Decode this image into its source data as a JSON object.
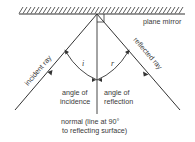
{
  "colors": {
    "line": "#333333",
    "text": "#3a3a3a",
    "background": "#ffffff"
  },
  "mirror": {
    "label": "plane mirror"
  },
  "rays": {
    "incident_label": "incident ray",
    "reflected_label": "reflected ray"
  },
  "angles": {
    "incidence_symbol": "i",
    "reflection_symbol": "r",
    "incidence_label_line1": "angle of",
    "incidence_label_line2": "incidence",
    "reflection_label_line1": "angle of",
    "reflection_label_line2": "reflection"
  },
  "normal": {
    "label_line1": "normal (line at 90°",
    "label_line2": "to reflecting surface)"
  }
}
